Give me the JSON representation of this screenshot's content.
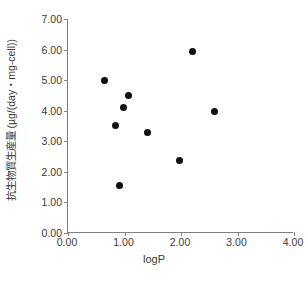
{
  "chart_data": {
    "type": "scatter",
    "title": "",
    "xlabel": "logP",
    "ylabel": "抗生物質生産量 (µg/(day・mg-cell))",
    "xlim": [
      0.0,
      4.0
    ],
    "ylim": [
      0.0,
      7.0
    ],
    "xticks": [
      "0.00",
      "1.00",
      "2.00",
      "3.00",
      "4.00"
    ],
    "xtick_values": [
      0.0,
      1.0,
      2.0,
      3.0,
      4.0
    ],
    "yticks": [
      "0.00",
      "1.00",
      "2.00",
      "3.00",
      "4.00",
      "5.00",
      "6.00",
      "7.00"
    ],
    "ytick_values": [
      0.0,
      1.0,
      2.0,
      3.0,
      4.0,
      5.0,
      6.0,
      7.0
    ],
    "grid": false,
    "legend": null,
    "marker": "filled-circle",
    "marker_color": "#111111",
    "axis_color": "#808080",
    "points": [
      {
        "x": 0.64,
        "y": 5.0
      },
      {
        "x": 0.84,
        "y": 3.53
      },
      {
        "x": 0.99,
        "y": 4.1
      },
      {
        "x": 0.92,
        "y": 1.56
      },
      {
        "x": 1.07,
        "y": 4.5
      },
      {
        "x": 1.4,
        "y": 3.3
      },
      {
        "x": 1.97,
        "y": 2.38
      },
      {
        "x": 2.2,
        "y": 5.95
      },
      {
        "x": 2.6,
        "y": 3.98
      }
    ]
  },
  "caption": ""
}
